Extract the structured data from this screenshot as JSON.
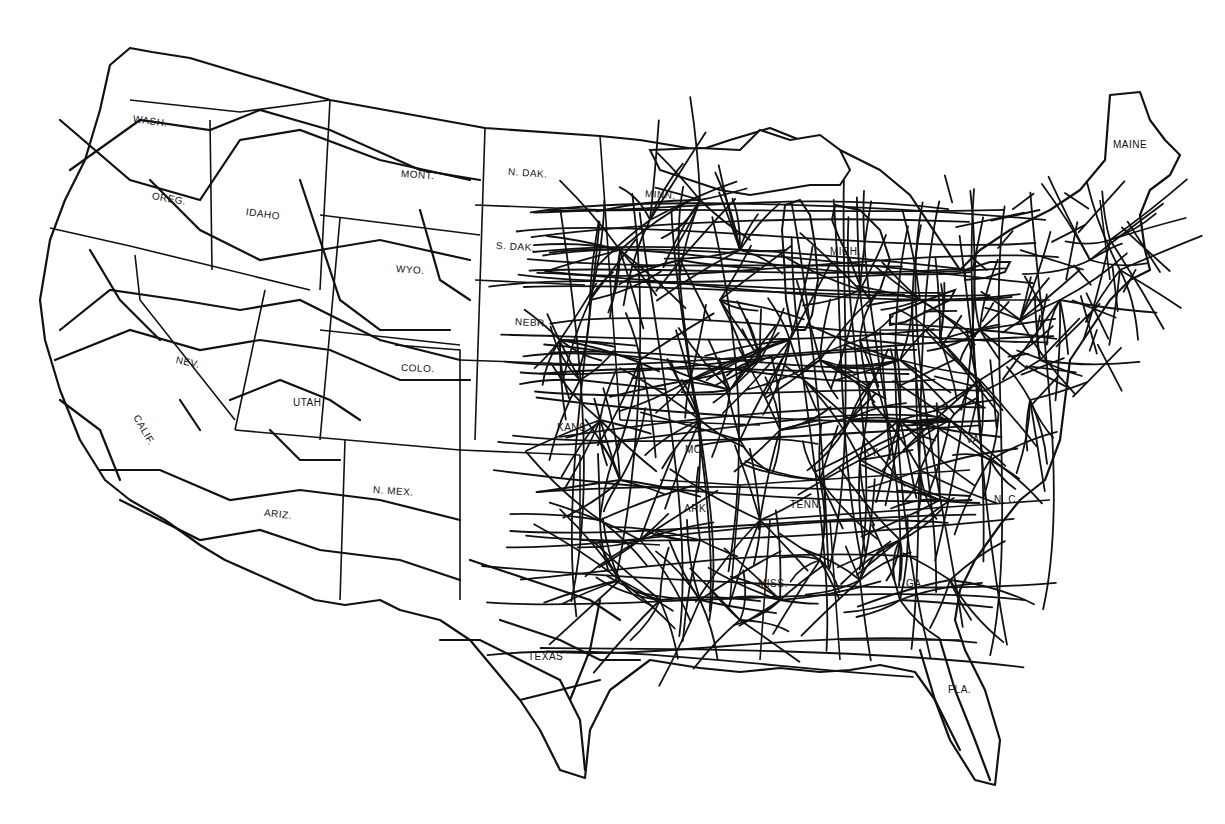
{
  "map": {
    "title": "United States Railroad Network",
    "colors": {
      "ink": "#111111",
      "background": "#ffffff"
    },
    "state_labels": [
      {
        "id": "wash",
        "text": "WASH.",
        "x": 133,
        "y": 113,
        "rotate": 8
      },
      {
        "id": "oreg",
        "text": "OREG.",
        "x": 152,
        "y": 190,
        "rotate": 10
      },
      {
        "id": "idaho",
        "text": "IDAHO",
        "x": 246,
        "y": 206,
        "rotate": 8
      },
      {
        "id": "mont",
        "text": "MONT.",
        "x": 401,
        "y": 168,
        "rotate": 4
      },
      {
        "id": "wyo",
        "text": "WYO.",
        "x": 396,
        "y": 263,
        "rotate": 4
      },
      {
        "id": "n-dak",
        "text": "N. DAK.",
        "x": 508,
        "y": 166,
        "rotate": 4
      },
      {
        "id": "s-dak",
        "text": "S. DAK.",
        "x": 496,
        "y": 240,
        "rotate": 3
      },
      {
        "id": "nebr",
        "text": "NEBR.",
        "x": 515,
        "y": 316,
        "rotate": 3
      },
      {
        "id": "minn",
        "text": "MINN.",
        "x": 645,
        "y": 188,
        "rotate": 4
      },
      {
        "id": "mich",
        "text": "MICH.",
        "x": 830,
        "y": 246,
        "rotate": 0
      },
      {
        "id": "maine",
        "text": "MAINE",
        "x": 1113,
        "y": 139,
        "rotate": 0
      },
      {
        "id": "nev",
        "text": "NEV.",
        "x": 176,
        "y": 354,
        "rotate": 12
      },
      {
        "id": "calif",
        "text": "CALIF.",
        "x": 136,
        "y": 410,
        "rotate": 60
      },
      {
        "id": "utah",
        "text": "UTAH",
        "x": 293,
        "y": 397,
        "rotate": 0
      },
      {
        "id": "colo",
        "text": "COLO.",
        "x": 401,
        "y": 362,
        "rotate": 2
      },
      {
        "id": "ariz",
        "text": "ARIZ.",
        "x": 264,
        "y": 507,
        "rotate": 6
      },
      {
        "id": "n-mex",
        "text": "N. MEX.",
        "x": 373,
        "y": 484,
        "rotate": 4
      },
      {
        "id": "kans",
        "text": "KANS.",
        "x": 557,
        "y": 422,
        "rotate": 0
      },
      {
        "id": "mo",
        "text": "MO.",
        "x": 685,
        "y": 444,
        "rotate": 0
      },
      {
        "id": "ky",
        "text": "KY.",
        "x": 864,
        "y": 447,
        "rotate": 0
      },
      {
        "id": "va",
        "text": "VA.",
        "x": 966,
        "y": 434,
        "rotate": 0
      },
      {
        "id": "ark",
        "text": "ARK.",
        "x": 684,
        "y": 503,
        "rotate": 0
      },
      {
        "id": "tenn",
        "text": "TENN.",
        "x": 790,
        "y": 499,
        "rotate": 0
      },
      {
        "id": "n-c",
        "text": "N. C.",
        "x": 994,
        "y": 494,
        "rotate": 0
      },
      {
        "id": "miss",
        "text": "MISS.",
        "x": 758,
        "y": 578,
        "rotate": 0
      },
      {
        "id": "ga",
        "text": "GA.",
        "x": 906,
        "y": 578,
        "rotate": 0
      },
      {
        "id": "texas",
        "text": "TEXAS",
        "x": 528,
        "y": 651,
        "rotate": 0
      },
      {
        "id": "fla",
        "text": "FLA.",
        "x": 948,
        "y": 684,
        "rotate": 0
      }
    ]
  }
}
